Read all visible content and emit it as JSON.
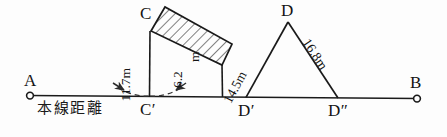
{
  "figure": {
    "baseline": {
      "left_point_label": "A",
      "right_point_label": "B",
      "caption": "本線距離",
      "foot_labels": [
        "C′",
        "D′",
        "D″"
      ]
    },
    "apex_labels": {
      "slab_top": "C",
      "triangle_apex": "D"
    },
    "dimensions": [
      {
        "id": "c-vertical",
        "value": "11.7",
        "unit": "m",
        "text": "11.7m"
      },
      {
        "id": "slab-right-vertical",
        "value": "6.2",
        "unit": "m",
        "text": "6.2",
        "unit_text": "m"
      },
      {
        "id": "triangle-left-side",
        "value": "14.5",
        "unit": "m",
        "text": "14.5m"
      },
      {
        "id": "triangle-right-side",
        "value": "16.8",
        "unit": "m",
        "text": "16.8m"
      }
    ],
    "colors": {
      "ink": "#141414",
      "line": "#1a1a1a",
      "hatch": "#222222",
      "dashed": "#333333",
      "background": "#fdfdfd"
    }
  }
}
